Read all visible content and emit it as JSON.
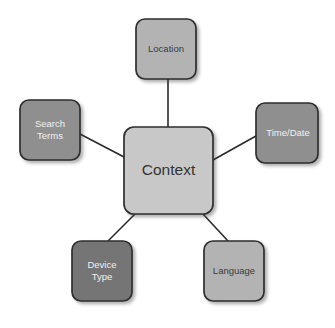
{
  "diagram": {
    "title": "Context",
    "type": "hub-and-spoke-mind-map",
    "background_color": "#ffffff",
    "center": {
      "id": "context",
      "label": "Context",
      "fill": "#c8c8c8",
      "stroke": "#2e2e2e",
      "text_color": "#333333",
      "x": 124,
      "y": 127,
      "width": 89,
      "height": 87,
      "radius": 10
    },
    "nodes": [
      {
        "id": "location",
        "label": "Location",
        "lines": [
          "Location"
        ],
        "fill": "#b3b3b3",
        "stroke": "#2e2e2e",
        "text_color": "#3b3b3b",
        "x": 136,
        "y": 19,
        "width": 60,
        "height": 60,
        "radius": 9
      },
      {
        "id": "search-terms",
        "label": "Search Terms",
        "lines": [
          "Search",
          "Terms"
        ],
        "fill": "#8f8f8f",
        "stroke": "#2e2e2e",
        "text_color": "#f2f2f2",
        "x": 20,
        "y": 100,
        "width": 60,
        "height": 60,
        "radius": 9
      },
      {
        "id": "time-date",
        "label": "Time/Date",
        "lines": [
          "Time/Date"
        ],
        "fill": "#8f8f8f",
        "stroke": "#2e2e2e",
        "text_color": "#f2f2f2",
        "x": 256,
        "y": 103,
        "width": 62,
        "height": 60,
        "radius": 9
      },
      {
        "id": "device-type",
        "label": "Device Type",
        "lines": [
          "Device",
          "Type"
        ],
        "fill": "#757575",
        "stroke": "#2e2e2e",
        "text_color": "#f2f2f2",
        "x": 72,
        "y": 241,
        "width": 60,
        "height": 60,
        "radius": 9
      },
      {
        "id": "language",
        "label": "Language",
        "lines": [
          "Language"
        ],
        "fill": "#b3b3b3",
        "stroke": "#2e2e2e",
        "text_color": "#3b3b3b",
        "x": 204,
        "y": 241,
        "width": 60,
        "height": 60,
        "radius": 9
      }
    ],
    "connectors": [
      {
        "id": "context-location",
        "from": "context",
        "to": "location",
        "x1": 168,
        "y1": 127,
        "x2": 168,
        "y2": 79
      },
      {
        "id": "context-search",
        "from": "context",
        "to": "search-terms",
        "x1": 124,
        "y1": 157,
        "x2": 80,
        "y2": 134
      },
      {
        "id": "context-timedate",
        "from": "context",
        "to": "time-date",
        "x1": 213,
        "y1": 160,
        "x2": 256,
        "y2": 136
      },
      {
        "id": "context-device",
        "from": "context",
        "to": "device-type",
        "x1": 135,
        "y1": 214,
        "x2": 108,
        "y2": 241
      },
      {
        "id": "context-language",
        "from": "context",
        "to": "language",
        "x1": 203,
        "y1": 214,
        "x2": 228,
        "y2": 241
      }
    ],
    "connector_color": "#2b2b2b",
    "shadow_color": "rgba(60,60,60,0.38)"
  }
}
